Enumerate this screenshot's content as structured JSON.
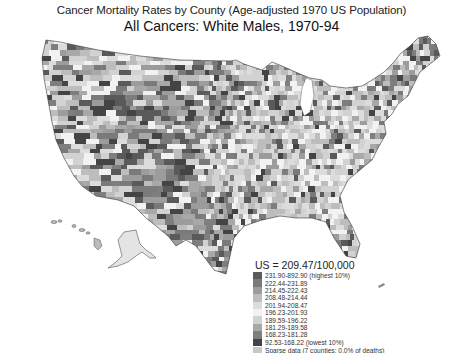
{
  "title": {
    "line1": "Cancer Mortality Rates by County (Age-adjusted 1970 US Population)",
    "line2": "All Cancers:  White Males, 1970-94"
  },
  "legend": {
    "us_rate": "US = 209.47/100,000",
    "items": [
      {
        "label": "231.90-892.90 (highest 10%)",
        "color": "#5a5a5a"
      },
      {
        "label": "222.44-231.89",
        "color": "#7a7a7a"
      },
      {
        "label": "214.45-222.43",
        "color": "#9c9c9c"
      },
      {
        "label": "208.48-214.44",
        "color": "#bdbdbd"
      },
      {
        "label": "201.94-208.47",
        "color": "#dcdcdc"
      },
      {
        "label": "196.23-201.93",
        "color": "#f2f2f2"
      },
      {
        "label": "189.59-196.22",
        "color": "#d2d2d2"
      },
      {
        "label": "181.29-189.58",
        "color": "#a8a8a8"
      },
      {
        "label": "168.23-181.28",
        "color": "#7e7e7e"
      },
      {
        "label": "92.53-168.22 (lowest 10%)",
        "color": "#444444"
      },
      {
        "label": "Sparse data (7 counties; 0.0% of deaths)",
        "color": "#c8c8c8"
      }
    ]
  },
  "map": {
    "subject": "Contiguous United States plus Alaska and Hawaii, county-level shading",
    "regions_note": "Dark shading concentrated in Rocky Mountain/Plains and south Texas; lighter in Northeast and Midwest"
  }
}
